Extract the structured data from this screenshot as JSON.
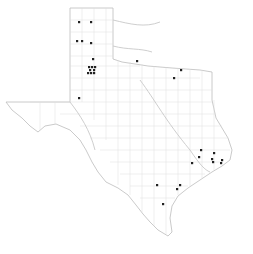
{
  "map": {
    "region": "Texas",
    "subdivisions": "counties",
    "colors": {
      "background": "#ffffff",
      "border": "#bdbdbd",
      "county_lines": "#dcdcdc",
      "dot": "#222222"
    },
    "occurrence_dots": [
      {
        "x": 79,
        "y": 22
      },
      {
        "x": 91,
        "y": 22
      },
      {
        "x": 77,
        "y": 41
      },
      {
        "x": 82,
        "y": 41
      },
      {
        "x": 91,
        "y": 43
      },
      {
        "x": 93,
        "y": 59
      },
      {
        "x": 89,
        "y": 67
      },
      {
        "x": 92,
        "y": 67
      },
      {
        "x": 95,
        "y": 67
      },
      {
        "x": 90,
        "y": 70
      },
      {
        "x": 94,
        "y": 70
      },
      {
        "x": 88,
        "y": 73
      },
      {
        "x": 91,
        "y": 73
      },
      {
        "x": 94,
        "y": 73
      },
      {
        "x": 79,
        "y": 98
      },
      {
        "x": 137,
        "y": 61
      },
      {
        "x": 181,
        "y": 70
      },
      {
        "x": 174,
        "y": 78
      },
      {
        "x": 201,
        "y": 150
      },
      {
        "x": 199,
        "y": 157
      },
      {
        "x": 192,
        "y": 163
      },
      {
        "x": 214,
        "y": 153
      },
      {
        "x": 212,
        "y": 159
      },
      {
        "x": 213,
        "y": 162
      },
      {
        "x": 221,
        "y": 163
      },
      {
        "x": 222,
        "y": 160
      },
      {
        "x": 157,
        "y": 185
      },
      {
        "x": 180,
        "y": 185
      },
      {
        "x": 177,
        "y": 189
      },
      {
        "x": 163,
        "y": 204
      }
    ]
  }
}
